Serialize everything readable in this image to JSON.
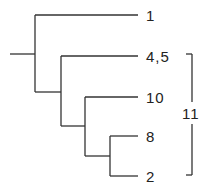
{
  "diagram": {
    "type": "dendrogram",
    "line_color": "#333333",
    "leaves": [
      {
        "label": "1"
      },
      {
        "label": "4,5"
      },
      {
        "label": "10"
      },
      {
        "label": "8"
      },
      {
        "label": "2"
      }
    ],
    "bracket": {
      "label": "11",
      "spans": [
        "4,5",
        "10",
        "8",
        "2"
      ]
    }
  }
}
